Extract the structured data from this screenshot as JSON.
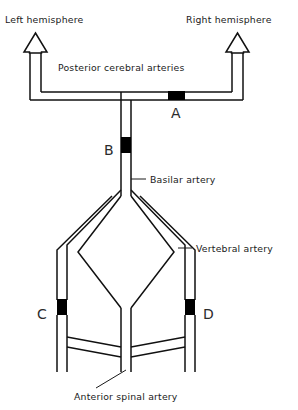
{
  "diagram": {
    "labels": {
      "left_hemisphere": "Left hemisphere",
      "right_hemisphere": "Right hemisphere",
      "posterior_cerebral_arteries": "Posterior cerebral arteries",
      "basilar_artery": "Basilar artery",
      "vertebral_artery": "Vertebral artery",
      "anterior_spinal_artery": "Anterior spinal artery"
    },
    "occlusion_markers": [
      {
        "id": "A",
        "label": "A",
        "vessel": "right posterior cerebral artery"
      },
      {
        "id": "B",
        "label": "B",
        "vessel": "basilar artery"
      },
      {
        "id": "C",
        "label": "C",
        "vessel": "left vertebral artery"
      },
      {
        "id": "D",
        "label": "D",
        "vessel": "right vertebral artery"
      }
    ],
    "colors": {
      "vessel_stroke": "#111111",
      "occlusion_fill": "#000000",
      "text": "#1a1a1a",
      "background": "#ffffff"
    },
    "flow_arrows": [
      {
        "direction": "up",
        "side": "left",
        "target": "Left hemisphere"
      },
      {
        "direction": "up",
        "side": "right",
        "target": "Right hemisphere"
      }
    ]
  }
}
